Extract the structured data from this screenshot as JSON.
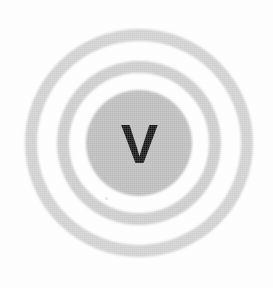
{
  "image": {
    "kind": "scanned-logo",
    "subject": "concentric-ring-emblem",
    "width": 273,
    "height": 288,
    "background_color": "#fdfdfd",
    "alt_text": "Concentric grey rings surrounding a grey disc containing a bold black letter V"
  },
  "emblem": {
    "name": "bullseye-ring-mark",
    "center_x": 139,
    "center_y": 143,
    "letter": "V",
    "letter_color": "#0c0c0c",
    "rings": [
      {
        "name": "outer-ring",
        "radius": 108,
        "stroke_width": 12,
        "color": "#cdcdcd"
      },
      {
        "name": "middle-ring",
        "radius": 76,
        "stroke_width": 12,
        "color": "#c9c9c9"
      }
    ],
    "core": {
      "name": "core-disc",
      "radius": 53,
      "color": "#b9b9b9"
    }
  },
  "artifacts": {
    "speck": {
      "name": "scan-speck",
      "x": 105,
      "y": 197,
      "color": "#d8d8d8"
    }
  }
}
